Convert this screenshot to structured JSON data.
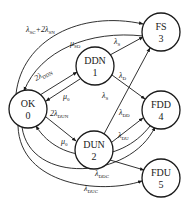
{
  "diagram": {
    "type": "state-transition (Markov) diagram",
    "nodes": [
      {
        "id": "n0",
        "name": "OK",
        "number": "0",
        "cx": 28,
        "cy": 109
      },
      {
        "id": "n1",
        "name": "DDN",
        "number": "1",
        "cx": 95,
        "cy": 66
      },
      {
        "id": "n2",
        "name": "DUN",
        "number": "2",
        "cx": 94,
        "cy": 150
      },
      {
        "id": "n3",
        "name": "FS",
        "number": "3",
        "cx": 161,
        "cy": 32
      },
      {
        "id": "n4",
        "name": "FDD",
        "number": "4",
        "cx": 161,
        "cy": 110
      },
      {
        "id": "n5",
        "name": "FDU",
        "number": "5",
        "cx": 161,
        "cy": 178
      }
    ],
    "edges": [
      {
        "from": "OK",
        "to": "FS",
        "label_main": "λ",
        "label_sub": "SC",
        "label_extra": "+2λ",
        "label_extra_sub": "SN"
      },
      {
        "from": "FS",
        "to": "OK",
        "label_main": "μ",
        "label_sub": "SO"
      },
      {
        "from": "DDN",
        "to": "FS",
        "label_main": "λ",
        "label_sub": "S"
      },
      {
        "from": "OK",
        "to": "DDN",
        "label_main": "2λ",
        "label_sub": "DDN"
      },
      {
        "from": "DDN",
        "to": "OK",
        "label_main": "μ",
        "label_sub": "0"
      },
      {
        "from": "DDN",
        "to": "FDD",
        "label_main": "λ",
        "label_sub": "D"
      },
      {
        "from": "DUN",
        "to": "FS",
        "label_main": "λ",
        "label_sub": "S"
      },
      {
        "from": "OK",
        "to": "DUN",
        "label_main": "2λ",
        "label_sub": "DUN"
      },
      {
        "from": "DUN",
        "to": "FDD",
        "label_main": "λ",
        "label_sub": "DD"
      },
      {
        "from": "FDD",
        "to": "OK",
        "label_main": "μ",
        "label_sub": "0"
      },
      {
        "from": "DUN",
        "to": "FDU",
        "label_main": "λ",
        "label_sub": "DU"
      },
      {
        "from": "OK",
        "to": "FDD",
        "label_main": "λ",
        "label_sub": "DDC"
      },
      {
        "from": "OK",
        "to": "FDU",
        "label_main": "λ",
        "label_sub": "DUC"
      }
    ]
  }
}
